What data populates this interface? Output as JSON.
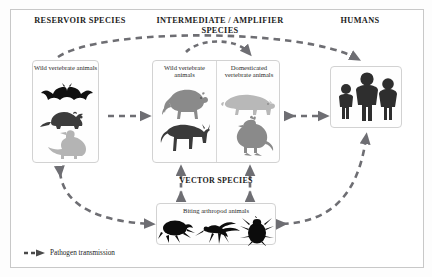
{
  "diagram": {
    "title_headers": {
      "reservoir": "RESERVOIR SPECIES",
      "intermediate": "INTERMEDIATE / AMPLIFIER SPECIES",
      "humans": "HUMANS",
      "vector": "VECTOR SPECIES"
    },
    "boxes": {
      "reservoir": {
        "label": "Wild vertebrate animals",
        "animals": [
          {
            "name": "bat-silhouette",
            "color": "#111111"
          },
          {
            "name": "rat-silhouette",
            "color": "#3c3c3c"
          },
          {
            "name": "duck-silhouette",
            "color": "#b4b4b4"
          }
        ]
      },
      "intermediate_wild": {
        "label": "Wild vertebrate animals",
        "animals": [
          {
            "name": "monkey-silhouette",
            "color": "#8a8a8a"
          },
          {
            "name": "deer-silhouette",
            "color": "#3a3a3a"
          }
        ]
      },
      "intermediate_domestic": {
        "label": "Domesticated vertebrate animals",
        "animals": [
          {
            "name": "pig-silhouette",
            "color": "#b8b8b8"
          },
          {
            "name": "chicken-silhouette",
            "color": "#8a8a8a"
          }
        ]
      },
      "humans": {
        "label": "",
        "figures": [
          {
            "name": "child-figure",
            "color": "#2e2e2e"
          },
          {
            "name": "adult-tall-figure",
            "color": "#2e2e2e"
          },
          {
            "name": "adult-figure",
            "color": "#2e2e2e"
          }
        ]
      },
      "vector": {
        "label": "Biting arthropod animals",
        "animals": [
          {
            "name": "flea-silhouette",
            "color": "#0c0c0c"
          },
          {
            "name": "mosquito-silhouette",
            "color": "#0c0c0c"
          },
          {
            "name": "tick-silhouette",
            "color": "#0c0c0c"
          }
        ]
      }
    },
    "legend": {
      "symbol": "dashed-arrow-icon",
      "text": "Pathogen transmission"
    },
    "arrows": [
      {
        "name": "reservoir-to-humans-arc",
        "from": "reservoir",
        "to": "humans",
        "direction": "one-way"
      },
      {
        "name": "reservoir-to-intermediate",
        "from": "reservoir",
        "to": "intermediate",
        "direction": "one-way"
      },
      {
        "name": "intermediate-wild-to-domestic-arc",
        "from": "intermediate_wild",
        "to": "intermediate_domestic",
        "direction": "one-way"
      },
      {
        "name": "intermediate-to-humans",
        "from": "intermediate",
        "to": "humans",
        "direction": "two-way"
      },
      {
        "name": "reservoir-to-vector-arc",
        "from": "reservoir",
        "to": "vector",
        "direction": "two-way"
      },
      {
        "name": "vector-to-intermediate-wild",
        "from": "vector",
        "to": "intermediate_wild",
        "direction": "two-way"
      },
      {
        "name": "vector-to-intermediate-domestic",
        "from": "vector",
        "to": "intermediate_domestic",
        "direction": "two-way"
      },
      {
        "name": "vector-to-humans-arc",
        "from": "vector",
        "to": "humans",
        "direction": "two-way"
      }
    ],
    "colors": {
      "arrow": "#6e6e73",
      "border": "#c8c8c8",
      "text": "#1c1c1c"
    }
  }
}
